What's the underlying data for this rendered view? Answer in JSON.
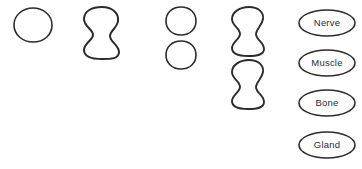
{
  "diagram": {
    "background_color": "#ffffff",
    "stroke_color": "#2b2b2f",
    "title": "",
    "shape_groups": [
      {
        "name": "column-1",
        "shape_type": "circle",
        "count": 1,
        "shapes": [
          {
            "id": "circle-1",
            "cx": 33,
            "cy": 25,
            "rx": 19,
            "ry": 17,
            "stroke_width": 1.6
          }
        ]
      },
      {
        "name": "column-2",
        "shape_type": "peanut",
        "count": 1,
        "shapes": [
          {
            "id": "peanut-1",
            "cx": 101,
            "cy": 33,
            "w": 36,
            "h": 52,
            "stroke_width": 2.0
          }
        ]
      },
      {
        "name": "column-3",
        "shape_type": "circle",
        "count": 2,
        "shapes": [
          {
            "id": "circle-2",
            "cx": 181,
            "cy": 21,
            "rx": 15,
            "ry": 14,
            "stroke_width": 1.6
          },
          {
            "id": "circle-3",
            "cx": 181,
            "cy": 55,
            "rx": 15,
            "ry": 14,
            "stroke_width": 1.6
          }
        ]
      },
      {
        "name": "column-4",
        "shape_type": "peanut",
        "count": 2,
        "shapes": [
          {
            "id": "peanut-2",
            "cx": 248,
            "cy": 31,
            "w": 33,
            "h": 48,
            "stroke_width": 1.9
          },
          {
            "id": "peanut-3",
            "cx": 248,
            "cy": 84,
            "w": 33,
            "h": 48,
            "stroke_width": 1.9
          }
        ]
      }
    ],
    "labels": [
      {
        "id": "label-nerve",
        "text": "Nerve",
        "cx": 327,
        "cy": 23,
        "rx": 28,
        "ry": 13,
        "stroke_width": 1.6
      },
      {
        "id": "label-muscle",
        "text": "Muscle",
        "cx": 327,
        "cy": 63,
        "rx": 28,
        "ry": 13,
        "stroke_width": 1.6
      },
      {
        "id": "label-bone",
        "text": "Bone",
        "cx": 327,
        "cy": 103,
        "rx": 28,
        "ry": 13,
        "stroke_width": 1.6
      },
      {
        "id": "label-gland",
        "text": "Gland",
        "cx": 327,
        "cy": 145,
        "rx": 28,
        "ry": 13,
        "stroke_width": 1.6
      }
    ]
  }
}
